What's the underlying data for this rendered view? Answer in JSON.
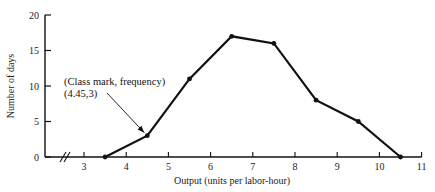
{
  "chart_data": {
    "type": "line",
    "title": "",
    "xlabel": "Output (units per labor-hour)",
    "ylabel": "Number of days",
    "x": [
      3.5,
      4.5,
      5.5,
      6.5,
      7.5,
      8.5,
      9.5,
      10.5
    ],
    "series": [
      {
        "name": "Frequency polygon",
        "values": [
          0,
          3,
          11,
          17,
          16,
          8,
          5,
          0
        ]
      }
    ],
    "xlim": [
      2,
      11
    ],
    "ylim": [
      0,
      20
    ],
    "x_ticks": [
      "3",
      "4",
      "5",
      "6",
      "7",
      "8",
      "9",
      "10",
      "11"
    ],
    "y_ticks": [
      "0",
      "5",
      "10",
      "15",
      "20"
    ],
    "axis_break": "//",
    "grid": false,
    "legend": null,
    "annotations": [
      {
        "line1": "(Class mark, frequency)",
        "line2": "(4.45,3)",
        "points_to": [
          4.5,
          3
        ]
      }
    ]
  }
}
